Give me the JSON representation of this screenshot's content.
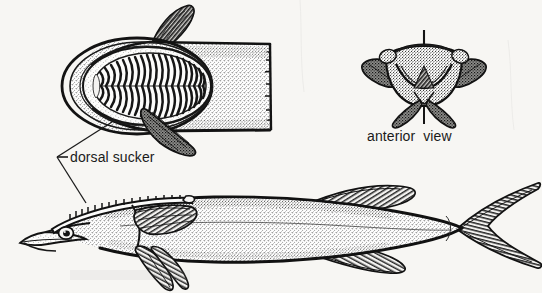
{
  "figure": {
    "kind": "scientific-illustration",
    "style": "black-and-white stippled ink drawing",
    "background_color": "#f7f6f3",
    "ink_color": "#1a1a1a",
    "panels": [
      {
        "id": "dorsal-view",
        "name": "dorsal view of head and anterior body",
        "position": "upper-left",
        "features": [
          "dorsal sucker disc",
          "paired lamellae",
          "pectoral fins",
          "truncated body"
        ]
      },
      {
        "id": "anterior-view",
        "name": "anterior view of head",
        "position": "upper-right",
        "features": [
          "sucker disc rim",
          "paired pectoral fins",
          "median axis line"
        ]
      },
      {
        "id": "lateral-view",
        "name": "lateral view of whole fish",
        "position": "lower",
        "features": [
          "eye",
          "lower jaw",
          "dorsal sucker",
          "pectoral fin",
          "pelvic fins",
          "dorsal fin",
          "anal fin",
          "forked caudal fin"
        ]
      }
    ]
  },
  "labels": {
    "dorsal_sucker": "dorsal sucker",
    "anterior_view": "anterior  view"
  },
  "leader": {
    "name": "dorsal-sucker-leader-line",
    "arrow_glyph": "←"
  },
  "sucker_detail": {
    "lamellae_pairs": 21,
    "disc_outline_rings": 3
  }
}
